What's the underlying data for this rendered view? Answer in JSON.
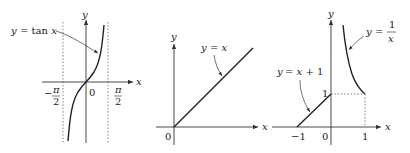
{
  "figure": {
    "panels": [
      {
        "name": "tan",
        "curve_label": "y = tan x",
        "x_axis_label": "x",
        "y_axis_label": "y",
        "origin_label": "0",
        "tick_labels": [
          "-π/2",
          "π/2"
        ],
        "asymptotes": [
          "x = -π/2",
          "x = π/2"
        ]
      },
      {
        "name": "identity",
        "curve_label": "y = x",
        "x_axis_label": "x",
        "y_axis_label": "y",
        "origin_label": "0"
      },
      {
        "name": "piecewise",
        "curve_labels": [
          "y = x + 1",
          "y = 1/x"
        ],
        "x_axis_label": "x",
        "y_axis_label": "y",
        "origin_label": "0",
        "x_tick_labels": [
          "-1",
          "1"
        ],
        "y_tick_labels": [
          "1"
        ]
      }
    ]
  },
  "text": {
    "y": "y",
    "x": "x",
    "eq": "=",
    "tan": "tan",
    "zero": "0",
    "minus": "−",
    "pi": "π",
    "two": "2",
    "one": "1",
    "neg_one": "−1",
    "plus_one": "+ 1",
    "p1_label_rest": "= tan x",
    "p2_label_rest": "= x",
    "p3a_label_rest": "= x + 1",
    "p3b_label_eq": "="
  }
}
